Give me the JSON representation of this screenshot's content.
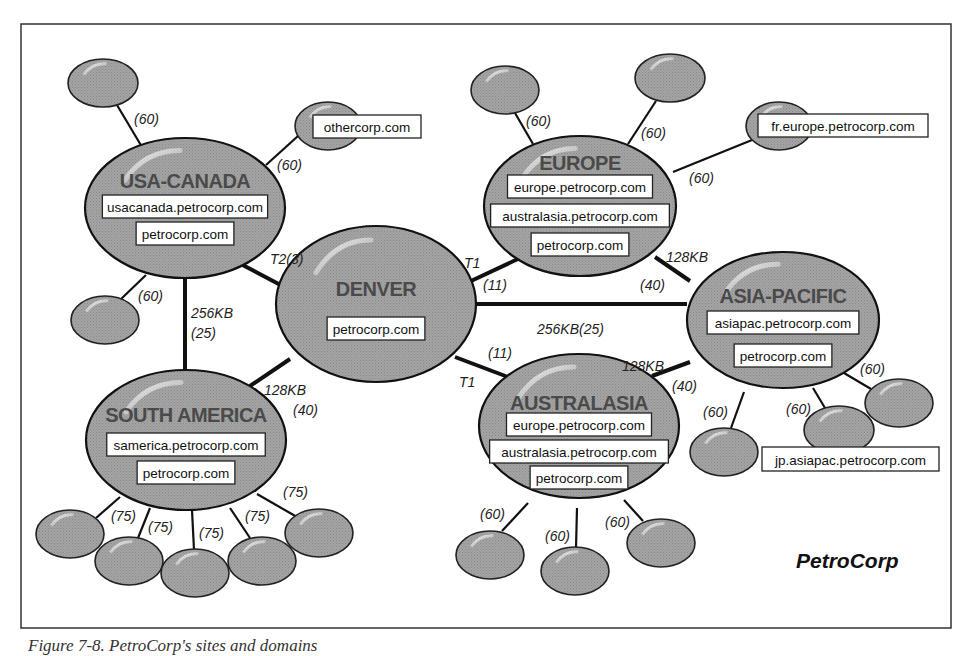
{
  "colors": {
    "node_fill": "#9a9a9a",
    "node_highlight": "#d8d8d8",
    "line": "#111111",
    "frame": "#333333"
  },
  "frame": {
    "x": 21,
    "y": 24,
    "w": 930,
    "h": 604
  },
  "brand": {
    "text": "PetroCorp",
    "x": 796,
    "y": 568
  },
  "caption": "Figure 7-8. PetroCorp's sites and domains",
  "sites": [
    {
      "id": "usa-canada",
      "title": "USA-CANADA",
      "cx": 185,
      "cy": 208,
      "rx": 100,
      "ry": 70,
      "title_y": 188,
      "domains": [
        {
          "text": "usacanada.petrocorp.com",
          "y": 206
        },
        {
          "text": "petrocorp.com",
          "y": 233
        }
      ]
    },
    {
      "id": "denver",
      "title": "DENVER",
      "cx": 376,
      "cy": 304,
      "rx": 100,
      "ry": 78,
      "title_y": 296,
      "domains": [
        {
          "text": "petrocorp.com",
          "y": 328
        }
      ]
    },
    {
      "id": "europe",
      "title": "EUROPE",
      "cx": 580,
      "cy": 206,
      "rx": 96,
      "ry": 70,
      "title_y": 170,
      "domains": [
        {
          "text": "europe.petrocorp.com",
          "y": 186
        },
        {
          "text": "australasia.petrocorp.com",
          "y": 215
        },
        {
          "text": "petrocorp.com",
          "y": 244
        }
      ]
    },
    {
      "id": "asia-pacific",
      "title": "ASIA-PACIFIC",
      "cx": 783,
      "cy": 320,
      "rx": 96,
      "ry": 68,
      "title_y": 303,
      "domains": [
        {
          "text": "asiapac.petrocorp.com",
          "y": 322
        },
        {
          "text": "petrocorp.com",
          "y": 355
        }
      ]
    },
    {
      "id": "south-america",
      "title": "SOUTH AMERICA",
      "cx": 186,
      "cy": 440,
      "rx": 100,
      "ry": 70,
      "title_y": 422,
      "domains": [
        {
          "text": "samerica.petrocorp.com",
          "y": 444
        },
        {
          "text": "petrocorp.com",
          "y": 472
        }
      ]
    },
    {
      "id": "australasia",
      "title": "AUSTRALASIA",
      "cx": 579,
      "cy": 426,
      "rx": 100,
      "ry": 72,
      "title_y": 410,
      "domains": [
        {
          "text": "europe.petrocorp.com",
          "y": 424
        },
        {
          "text": "australasia.petrocorp.com",
          "y": 451
        },
        {
          "text": "petrocorp.com",
          "y": 477
        }
      ]
    }
  ],
  "backbone_links": [
    {
      "from": [
        237,
        262
      ],
      "to": [
        290,
        290
      ],
      "width": 4,
      "labels": [
        {
          "text": "T2(3)",
          "x": 270,
          "y": 264
        }
      ]
    },
    {
      "from": [
        185,
        278
      ],
      "to": [
        185,
        370
      ],
      "width": 4,
      "labels": [
        {
          "text": "256KB",
          "x": 191,
          "y": 318
        },
        {
          "text": "(25)",
          "x": 191,
          "y": 338
        }
      ]
    },
    {
      "from": [
        456,
        288
      ],
      "to": [
        520,
        258
      ],
      "width": 4,
      "labels": [
        {
          "text": "T1",
          "x": 464,
          "y": 268
        },
        {
          "text": "(11)",
          "x": 483,
          "y": 290
        }
      ]
    },
    {
      "from": [
        476,
        304
      ],
      "to": [
        687,
        304
      ],
      "width": 4,
      "labels": [
        {
          "text": "256KB(25)",
          "x": 537,
          "y": 334
        }
      ]
    },
    {
      "from": [
        455,
        357
      ],
      "to": [
        508,
        377
      ],
      "width": 4,
      "labels": [
        {
          "text": "(11)",
          "x": 488,
          "y": 358
        },
        {
          "text": "T1",
          "x": 459,
          "y": 387
        }
      ]
    },
    {
      "from": [
        290,
        359
      ],
      "to": [
        250,
        386
      ],
      "width": 4,
      "labels": [
        {
          "text": "128KB",
          "x": 264,
          "y": 395
        },
        {
          "text": "(40)",
          "x": 293,
          "y": 415
        }
      ]
    },
    {
      "from": [
        655,
        257
      ],
      "to": [
        690,
        281
      ],
      "width": 4,
      "labels": [
        {
          "text": "128KB",
          "x": 666,
          "y": 262
        },
        {
          "text": "(40)",
          "x": 640,
          "y": 290
        }
      ]
    },
    {
      "from": [
        652,
        376
      ],
      "to": [
        690,
        362
      ],
      "width": 4,
      "labels": [
        {
          "text": "128KB",
          "x": 622,
          "y": 371
        },
        {
          "text": "(40)",
          "x": 672,
          "y": 391
        }
      ]
    }
  ],
  "leaves": [
    {
      "cx": 103,
      "cy": 83,
      "rx": 35,
      "ry": 24,
      "line": [
        [
          117,
          105
        ],
        [
          142,
          147
        ]
      ],
      "cost": {
        "text": "(60)",
        "x": 134,
        "y": 124
      }
    },
    {
      "cx": 328,
      "cy": 126,
      "rx": 33,
      "ry": 24,
      "line": [
        [
          298,
          136
        ],
        [
          266,
          165
        ]
      ],
      "cost": {
        "text": "(60)",
        "x": 277,
        "y": 170
      },
      "label": {
        "text": "othercorp.com",
        "x": 313,
        "y": 115,
        "w": 108,
        "h": 23
      }
    },
    {
      "cx": 105,
      "cy": 320,
      "rx": 34,
      "ry": 24,
      "line": [
        [
          120,
          300
        ],
        [
          146,
          275
        ]
      ],
      "cost": {
        "text": "(60)",
        "x": 138,
        "y": 301
      }
    },
    {
      "cx": 505,
      "cy": 90,
      "rx": 34,
      "ry": 24,
      "line": [
        [
          515,
          113
        ],
        [
          533,
          144
        ]
      ],
      "cost": {
        "text": "(60)",
        "x": 526,
        "y": 126
      }
    },
    {
      "cx": 670,
      "cy": 78,
      "rx": 35,
      "ry": 24,
      "line": [
        [
          656,
          101
        ],
        [
          628,
          144
        ]
      ],
      "cost": {
        "text": "(60)",
        "x": 641,
        "y": 138
      }
    },
    {
      "cx": 779,
      "cy": 126,
      "rx": 33,
      "ry": 24,
      "line": [
        [
          752,
          140
        ],
        [
          673,
          172
        ]
      ],
      "cost": {
        "text": "(60)",
        "x": 689,
        "y": 183
      },
      "label": {
        "text": "fr.europe.petrocorp.com",
        "x": 758,
        "y": 114,
        "w": 170,
        "h": 23
      }
    },
    {
      "cx": 724,
      "cy": 452,
      "rx": 34,
      "ry": 24,
      "line": [
        [
          731,
          428
        ],
        [
          744,
          392
        ]
      ],
      "cost": {
        "text": "(60)",
        "x": 703,
        "y": 417
      }
    },
    {
      "cx": 839,
      "cy": 430,
      "rx": 35,
      "ry": 24,
      "line": [
        [
          825,
          408
        ],
        [
          813,
          388
        ]
      ],
      "cost": {
        "text": "(60)",
        "x": 786,
        "y": 414
      },
      "label": {
        "text": "jp.asiapac.petrocorp.com",
        "x": 762,
        "y": 447,
        "w": 177,
        "h": 24
      }
    },
    {
      "cx": 899,
      "cy": 403,
      "rx": 34,
      "ry": 24,
      "line": [
        [
          871,
          389
        ],
        [
          844,
          373
        ]
      ],
      "cost": {
        "text": "(60)",
        "x": 860,
        "y": 374
      }
    },
    {
      "cx": 490,
      "cy": 555,
      "rx": 34,
      "ry": 24,
      "line": [
        [
          502,
          531
        ],
        [
          528,
          503
        ]
      ],
      "cost": {
        "text": "(60)",
        "x": 480,
        "y": 519
      }
    },
    {
      "cx": 575,
      "cy": 571,
      "rx": 34,
      "ry": 24,
      "line": [
        [
          576,
          548
        ],
        [
          577,
          508
        ]
      ],
      "cost": {
        "text": "(60)",
        "x": 545,
        "y": 541
      }
    },
    {
      "cx": 661,
      "cy": 543,
      "rx": 34,
      "ry": 24,
      "line": [
        [
          643,
          521
        ],
        [
          624,
          500
        ]
      ],
      "cost": {
        "text": "(60)",
        "x": 605,
        "y": 527
      }
    },
    {
      "cx": 70,
      "cy": 534,
      "rx": 34,
      "ry": 24,
      "line": [
        [
          96,
          518
        ],
        [
          120,
          497
        ]
      ],
      "cost": {
        "text": "(75)",
        "x": 111,
        "y": 521
      }
    },
    {
      "cx": 129,
      "cy": 561,
      "rx": 34,
      "ry": 24,
      "line": [
        [
          138,
          538
        ],
        [
          150,
          508
        ]
      ],
      "cost": {
        "text": "(75)",
        "x": 148,
        "y": 532
      }
    },
    {
      "cx": 195,
      "cy": 573,
      "rx": 34,
      "ry": 24,
      "line": [
        [
          194,
          550
        ],
        [
          192,
          510
        ]
      ],
      "cost": {
        "text": "(75)",
        "x": 199,
        "y": 538
      }
    },
    {
      "cx": 262,
      "cy": 561,
      "rx": 34,
      "ry": 24,
      "line": [
        [
          250,
          538
        ],
        [
          230,
          508
        ]
      ],
      "cost": {
        "text": "(75)",
        "x": 245,
        "y": 521
      }
    },
    {
      "cx": 319,
      "cy": 533,
      "rx": 34,
      "ry": 24,
      "line": [
        [
          297,
          517
        ],
        [
          257,
          494
        ]
      ],
      "cost": {
        "text": "(75)",
        "x": 283,
        "y": 497
      }
    }
  ]
}
